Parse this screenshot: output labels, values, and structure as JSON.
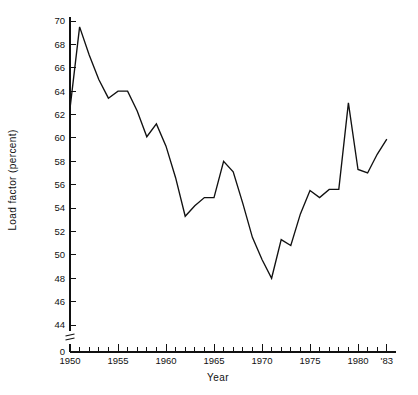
{
  "chart_data": {
    "type": "line",
    "title": "",
    "xlabel": "Year",
    "ylabel": "Load factor (percent)",
    "xlim": [
      1949,
      1983.5
    ],
    "ylim": [
      43,
      70.6
    ],
    "grid": false,
    "legend": false,
    "axis_break": true,
    "y_axis_baseline_label": "0",
    "x": [
      1950,
      1951,
      1952,
      1953,
      1954,
      1955,
      1956,
      1957,
      1958,
      1959,
      1960,
      1961,
      1962,
      1963,
      1964,
      1965,
      1966,
      1967,
      1968,
      1969,
      1970,
      1971,
      1972,
      1973,
      1974,
      1975,
      1976,
      1977,
      1978,
      1979,
      1980,
      1981,
      1982,
      1983
    ],
    "values": [
      62.5,
      69.5,
      67.1,
      65.0,
      63.4,
      64.0,
      64.0,
      62.3,
      60.1,
      61.2,
      59.3,
      56.6,
      53.3,
      54.2,
      54.9,
      54.9,
      58.0,
      57.1,
      54.4,
      51.5,
      49.6,
      48.0,
      51.3,
      50.8,
      53.5,
      55.5,
      54.9,
      55.6,
      55.6,
      63.0,
      57.3,
      57.0,
      58.6,
      59.9
    ],
    "series": [
      {
        "name": "Load factor",
        "values": [
          62.5,
          69.5,
          67.1,
          65.0,
          63.4,
          64.0,
          64.0,
          62.3,
          60.1,
          61.2,
          59.3,
          56.6,
          53.3,
          54.2,
          54.9,
          54.9,
          58.0,
          57.1,
          54.4,
          51.5,
          49.6,
          48.0,
          51.3,
          50.8,
          53.5,
          55.5,
          54.9,
          55.6,
          55.6,
          63.0,
          57.3,
          57.0,
          58.6,
          59.9
        ]
      }
    ],
    "yticks": [
      44,
      46,
      48,
      50,
      52,
      54,
      56,
      58,
      60,
      62,
      64,
      66,
      68,
      70
    ],
    "yticklabels": [
      "44",
      "46",
      "48",
      "50",
      "52",
      "54",
      "56",
      "58",
      "60",
      "62",
      "64",
      "66",
      "68",
      "70"
    ],
    "xticks": [
      1950,
      1955,
      1960,
      1965,
      1970,
      1975,
      1980,
      1983
    ],
    "xticklabels": [
      "1950",
      "1955",
      "1960",
      "1965",
      "1970",
      "1975",
      "1980",
      "'83"
    ],
    "x_minor_ticks": [
      1951,
      1952,
      1953,
      1954,
      1956,
      1957,
      1958,
      1959,
      1961,
      1962,
      1963,
      1964,
      1966,
      1967,
      1968,
      1969,
      1971,
      1972,
      1973,
      1974,
      1976,
      1977,
      1978,
      1979,
      1981,
      1982
    ],
    "line_color": "#111111",
    "axis_color": "#111111",
    "background_color": "#ffffff"
  }
}
